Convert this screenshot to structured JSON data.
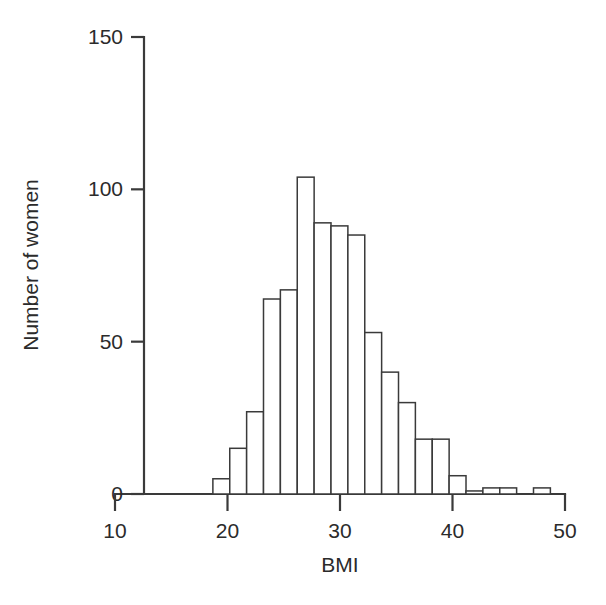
{
  "chart_data": {
    "type": "bar",
    "title": "",
    "subtitle": "",
    "xlabel": "BMI",
    "ylabel": "Number of women",
    "xlim": [
      10,
      50
    ],
    "ylim": [
      0,
      150
    ],
    "xticks": [
      10,
      20,
      30,
      40,
      50
    ],
    "xtick_labels": [
      "10",
      "20",
      "30",
      "40",
      "50"
    ],
    "yticks": [
      0,
      50,
      100,
      150
    ],
    "ytick_labels": [
      "0",
      "50",
      "100",
      "150"
    ],
    "grid": false,
    "legend": null,
    "bin_width": 1.5,
    "bin_edges": [
      18.7,
      20.2,
      21.7,
      23.2,
      24.7,
      26.2,
      27.7,
      29.2,
      30.7,
      32.2,
      33.7,
      35.2,
      36.7,
      38.2,
      39.7,
      41.2,
      42.7,
      44.2,
      45.7,
      47.2,
      48.7
    ],
    "bin_centers": [
      19.45,
      20.95,
      22.45,
      23.95,
      25.45,
      26.95,
      28.45,
      29.95,
      31.45,
      32.95,
      34.45,
      35.95,
      37.45,
      38.95,
      40.45,
      41.95,
      43.45,
      44.95,
      46.45,
      47.95
    ],
    "values": [
      5,
      15,
      27,
      64,
      67,
      104,
      89,
      88,
      85,
      53,
      40,
      30,
      18,
      18,
      6,
      1,
      2,
      2,
      0,
      2
    ],
    "bar_fill_color": "#ffffff",
    "bar_edge_color": "#3a3a3a",
    "axis_color": "#3a3a3a",
    "background_color": "#ffffff"
  }
}
